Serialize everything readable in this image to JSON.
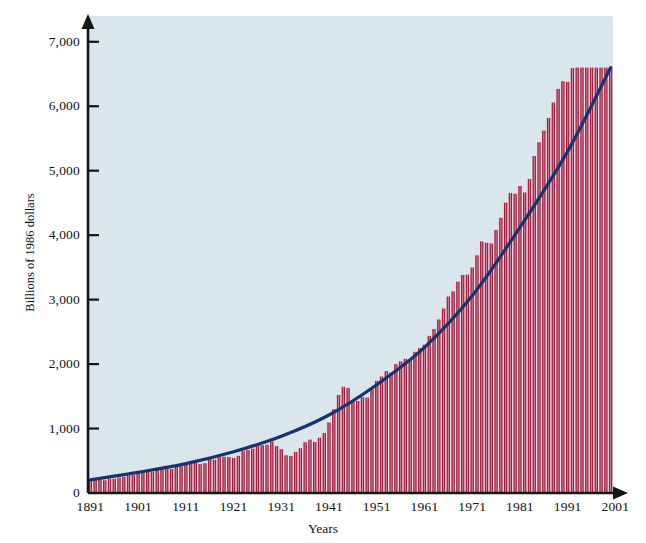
{
  "figure": {
    "background_color": "#ffffff",
    "plot_background_color": "#dbe5ec",
    "bar_color": "#b01c3e",
    "bar_highlight_color": "#d9859c",
    "bar_edge_color": "#8c122f",
    "line_color": "#16356f",
    "axis_color": "#161616"
  },
  "chart_data": {
    "type": "bar",
    "title": "",
    "subtitle": "",
    "xlabel": "Years",
    "ylabel": "Billions of 1986 dollars",
    "xlim": [
      1891,
      2001
    ],
    "ylim": [
      0,
      7400
    ],
    "grid": false,
    "legend": "none",
    "y_ticks": [
      0,
      1000,
      2000,
      3000,
      4000,
      5000,
      6000,
      7000
    ],
    "y_tick_labels": [
      "0",
      "1,000",
      "2,000",
      "3,000",
      "4,000",
      "5,000",
      "6,000",
      "7,000"
    ],
    "x_ticks": [
      1891,
      1901,
      1911,
      1921,
      1931,
      1941,
      1951,
      1961,
      1971,
      1981,
      1991,
      2001
    ],
    "x_tick_labels": [
      "1891",
      "1901",
      "1911",
      "1921",
      "1931",
      "1941",
      "1951",
      "1961",
      "1971",
      "1981",
      "1991",
      "2001"
    ],
    "series": [
      {
        "name": "Real output (bars)",
        "type": "bar",
        "x": [
          1891,
          1892,
          1893,
          1894,
          1895,
          1896,
          1897,
          1898,
          1899,
          1900,
          1901,
          1902,
          1903,
          1904,
          1905,
          1906,
          1907,
          1908,
          1909,
          1910,
          1911,
          1912,
          1913,
          1914,
          1915,
          1916,
          1917,
          1918,
          1919,
          1920,
          1921,
          1922,
          1923,
          1924,
          1925,
          1926,
          1927,
          1928,
          1929,
          1930,
          1931,
          1932,
          1933,
          1934,
          1935,
          1936,
          1937,
          1938,
          1939,
          1940,
          1941,
          1942,
          1943,
          1944,
          1945,
          1946,
          1947,
          1948,
          1949,
          1950,
          1951,
          1952,
          1953,
          1954,
          1955,
          1956,
          1957,
          1958,
          1959,
          1960,
          1961,
          1962,
          1963,
          1964,
          1965,
          1966,
          1967,
          1968,
          1969,
          1970,
          1971,
          1972,
          1973,
          1974,
          1975,
          1976,
          1977,
          1978,
          1979,
          1980,
          1981,
          1982,
          1983,
          1984,
          1985,
          1986,
          1987,
          1988,
          1989,
          1990,
          1991,
          1992,
          1993,
          1994,
          1995,
          1996,
          1997,
          1998,
          1999,
          2000
        ],
        "values": [
          205,
          215,
          205,
          198,
          222,
          222,
          240,
          248,
          272,
          280,
          312,
          318,
          332,
          328,
          358,
          398,
          405,
          372,
          418,
          428,
          442,
          470,
          485,
          448,
          462,
          528,
          518,
          562,
          562,
          558,
          545,
          578,
          652,
          668,
          688,
          735,
          742,
          748,
          800,
          728,
          680,
          585,
          575,
          638,
          695,
          788,
          828,
          792,
          858,
          932,
          1095,
          1300,
          1520,
          1648,
          1630,
          1442,
          1428,
          1488,
          1482,
          1612,
          1740,
          1808,
          1892,
          1868,
          2000,
          2042,
          2082,
          2062,
          2190,
          2248,
          2300,
          2438,
          2545,
          2692,
          2862,
          3048,
          3128,
          3278,
          3382,
          3388,
          3500,
          3688,
          3902,
          3882,
          3872,
          4082,
          4270,
          4505,
          4652,
          4642,
          4762,
          4662,
          4872,
          5228,
          5442,
          5622,
          5818,
          6058,
          6270,
          6388,
          6378,
          6592,
          6772,
          7052,
          7228,
          7498,
          7825,
          8158,
          8508,
          6600
        ],
        "note": "Bar heights rendered against ylim 0-7400; final plotted bar peaks at approximately 6,600."
      },
      {
        "name": "Trend (smooth curve)",
        "type": "line",
        "x": [
          1891,
          1901,
          1911,
          1921,
          1931,
          1941,
          1951,
          1961,
          1971,
          1981,
          1991,
          2000
        ],
        "values": [
          205,
          320,
          455,
          640,
          880,
          1210,
          1680,
          2260,
          3060,
          4120,
          5300,
          6600
        ]
      }
    ],
    "annotations": [
      {
        "label": "Great Depression trough",
        "x": 1933,
        "y": 575
      },
      {
        "label": "World War II peak",
        "x": 1944,
        "y": 1648
      }
    ]
  }
}
